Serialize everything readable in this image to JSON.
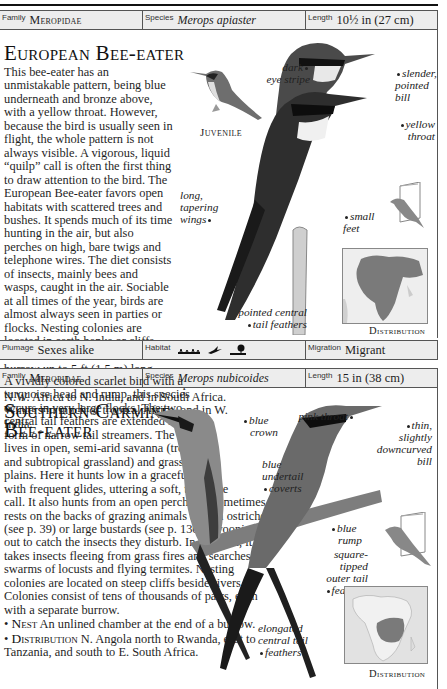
{
  "entries": [
    {
      "family_label": "Family",
      "family": "Meropidae",
      "species_label": "Species",
      "species": "Merops apiaster",
      "length_label": "Length",
      "length": "10½ in (27 cm)",
      "title": "European Bee-eater",
      "body": "This bee-eater has an unmistakable pattern, being blue underneath and bronze above, with a yellow throat. However, because the bird is usually seen in flight, the whole pattern is not always visible. A vigorous, liquid “quilp” call is often the first thing to draw attention to the bird. The European Bee-eater favors open habitats with scattered trees and bushes. It spends much of its time hunting in the air, but also perches on high, bare twigs and telephone wires. The diet consists of insects, mainly bees and wasps, caught in the air. Sociable at all times of the year, birds are almost always seen in parties or flocks. Nesting colonies are located in earth banks or cliffs.",
      "nest_head": "Nest",
      "nest": "An unlined chamber at the end of a burrow up to 5 ft (1.5 m) long.",
      "distribution_head": "Distribution",
      "distribution": "Breeds from S. Europe and N.W. Africa to N. India, and in South Africa. Winters in much of tropical Africa, and in W. India.",
      "juvenile_label": "Juvenile",
      "annotations": {
        "dark_eye_stripe": [
          "dark",
          "eye stripe"
        ],
        "slender_bill": [
          "slender,",
          "pointed",
          "bill"
        ],
        "yellow_throat": [
          "yellow",
          "throat"
        ],
        "long_wings": [
          "long,",
          "tapering",
          "wings"
        ],
        "small_feet": [
          "small",
          "feet"
        ],
        "pointed_tail": [
          "pointed central",
          "tail feathers"
        ]
      },
      "distribution_caption": "Distribution",
      "plumage_label": "Plumage",
      "plumage": "Sexes alike",
      "habitat_label": "Habitat",
      "habitat_icons": [
        "grassland-icon",
        "flying-bird-icon",
        "scrub-tree-icon"
      ],
      "migration_label": "Migration",
      "migration": "Migrant"
    },
    {
      "family_label": "Family",
      "family": "Meropidae",
      "species_label": "Species",
      "species": "Merops nubicoides",
      "length_label": "Length",
      "length": "15 in (38 cm)",
      "title_line1": "Southern Carmine",
      "title_line2": "Bee-eater",
      "body": "A vividly colored scarlet bird with a turquoise head and rump, this species occurs in very large flocks. The two central tail feathers are extended in the form of narrow tail streamers. The species lives in open, semi-arid savanna (tropical and subtropical grassland) and grassy river plains. Here it hunts low in a graceful flight with frequent glides, uttering a soft, two-note call. It also hunts from an open perch and sometimes rests on the backs of grazing animals and on ostriches (see p. 39) or large bustards (see p. 130), swooping out to catch the insects they disturb. In addition, it takes insects fleeing from grass fires and searches out swarms of locusts and flying termites. Nesting colonies are located on steep cliffs beside rivers. Colonies consist of tens of thousands of pairs, each with a separate burrow.",
      "nest_head": "Nest",
      "nest": "An unlined chamber at the end of a burrow.",
      "distribution_head": "Distribution",
      "distribution": "N. Angola north to Rwanda, east to Tanzania, and south to E. South Africa.",
      "annotations": {
        "blue_crown": [
          "blue",
          "crown"
        ],
        "pink_throat": [
          "pink throat"
        ],
        "thin_bill": [
          "thin,",
          "slightly",
          "downcurved",
          "bill"
        ],
        "blue_undertail": [
          "blue",
          "undertail",
          "coverts"
        ],
        "blue_rump": [
          "blue",
          "rump"
        ],
        "square_tail": [
          "square-",
          "tipped",
          "outer tail",
          "feathers"
        ],
        "elongated_tail": [
          "elongated",
          "central tail",
          "feathers"
        ]
      },
      "distribution_caption": "Distribution"
    }
  ],
  "colors": {
    "bar_bg": "#ededed",
    "rule": "#555555",
    "map_range": "#7a7a7a",
    "map_land": "#d9d9d9"
  }
}
